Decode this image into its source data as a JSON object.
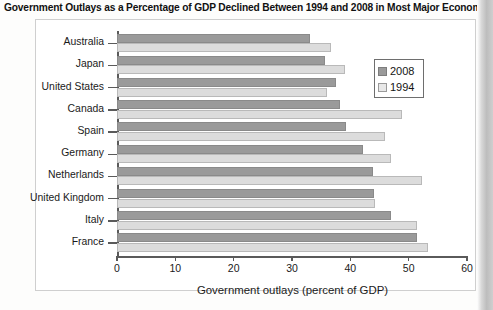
{
  "title": "Government Outlays as a Percentage of GDP Declined Between 1994 and 2008 in Most Major Economies",
  "legend": {
    "items": [
      {
        "label": "2008",
        "color": "#9a9a9a"
      },
      {
        "label": "1994",
        "color": "#e8e8e8"
      }
    ]
  },
  "axis": {
    "x_title": "Government outlays (percent of GDP)",
    "x_ticks": [
      "0",
      "10",
      "20",
      "30",
      "40",
      "50",
      "60"
    ]
  },
  "chart_data": {
    "type": "bar",
    "orientation": "horizontal",
    "title": "Government Outlays as a Percentage of GDP Declined Between 1994 and 2008 in Most Major Economies",
    "xlabel": "Government outlays (percent of GDP)",
    "ylabel": "",
    "xlim": [
      0,
      60
    ],
    "xticks": [
      0,
      10,
      20,
      30,
      40,
      50,
      60
    ],
    "grid": false,
    "legend_position": "upper-right-inside",
    "categories": [
      "Australia",
      "Japan",
      "United States",
      "Canada",
      "Spain",
      "Germany",
      "Netherlands",
      "United Kingdom",
      "Italy",
      "France"
    ],
    "series": [
      {
        "name": "2008",
        "color": "#9a9a9a",
        "values": [
          33.0,
          35.7,
          37.6,
          38.2,
          39.2,
          42.2,
          43.8,
          44.1,
          47.0,
          51.5
        ]
      },
      {
        "name": "1994",
        "color": "#e8e8e8",
        "values": [
          36.7,
          39.0,
          36.0,
          48.8,
          45.9,
          46.9,
          52.3,
          44.3,
          51.5,
          53.3
        ]
      }
    ]
  }
}
